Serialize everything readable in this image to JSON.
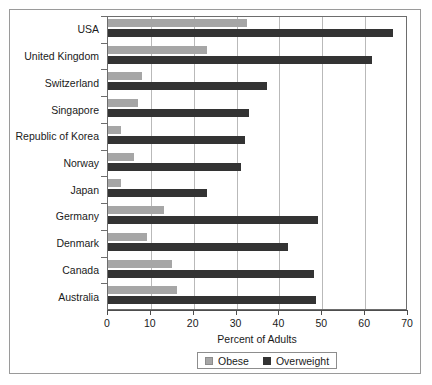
{
  "chart_data": {
    "type": "bar",
    "orientation": "horizontal",
    "title": "",
    "xlabel": "Percent of Adults",
    "ylabel": "",
    "xlim": [
      0,
      70
    ],
    "xticks": [
      0,
      10,
      20,
      30,
      40,
      50,
      60,
      70
    ],
    "grid": "vertical",
    "legend_position": "bottom",
    "categories": [
      "USA",
      "United Kingdom",
      "Switzerland",
      "Singapore",
      "Republic of Korea",
      "Norway",
      "Japan",
      "Germany",
      "Denmark",
      "Canada",
      "Australia"
    ],
    "series": [
      {
        "name": "Obese",
        "color": "#a6a6a6",
        "values": [
          32.5,
          23,
          8,
          7,
          3,
          6,
          3,
          13,
          9,
          15,
          16
        ]
      },
      {
        "name": "Overweight",
        "color": "#333333",
        "values": [
          66.5,
          61.5,
          37,
          33,
          32,
          31,
          23,
          49,
          42,
          48,
          48.5
        ]
      }
    ]
  },
  "legend": {
    "items": [
      {
        "label": "Obese",
        "swatch": "swatch-obese"
      },
      {
        "label": "Overweight",
        "swatch": "swatch-over"
      }
    ]
  }
}
